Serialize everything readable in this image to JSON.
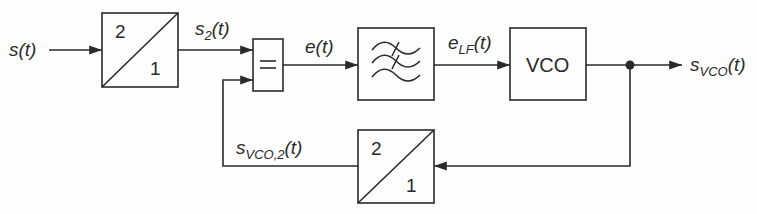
{
  "diagram": {
    "type": "block-diagram",
    "signals": {
      "input": {
        "base": "s(t)"
      },
      "s2": {
        "base": "s",
        "sub": "2",
        "arg": "(t)"
      },
      "error": {
        "base": "e(t)"
      },
      "e_lf": {
        "base": "e",
        "sub": "LF",
        "arg": "(t)"
      },
      "output": {
        "base": "s",
        "sub": "VCO",
        "arg": "(t)"
      },
      "feedback": {
        "base": "s",
        "sub": "VCO,2",
        "arg": "(t)"
      }
    },
    "blocks": {
      "divider_in": {
        "top": "2",
        "bottom": "1"
      },
      "comparator": {
        "symbol": "="
      },
      "filter": {
        "icon": "lowpass-filter-icon"
      },
      "vco": {
        "label": "VCO"
      },
      "divider_fb": {
        "top": "2",
        "bottom": "1"
      }
    },
    "colors": {
      "line": "#2a2a2a",
      "background": "#fdfdfd"
    }
  }
}
